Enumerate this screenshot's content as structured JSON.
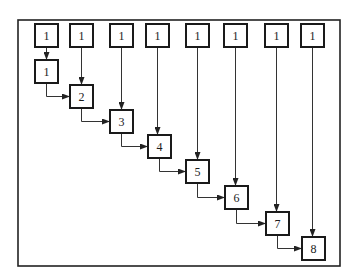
{
  "diagram": {
    "type": "cascade-flow",
    "frame": {
      "x": 18,
      "y": 20,
      "w": 322,
      "h": 246
    },
    "box_size": 23,
    "top_row": [
      {
        "label": "1",
        "x": 35
      },
      {
        "label": "1",
        "x": 70
      },
      {
        "label": "1",
        "x": 110
      },
      {
        "label": "1",
        "x": 146
      },
      {
        "label": "1",
        "x": 186
      },
      {
        "label": "1",
        "x": 224
      },
      {
        "label": "1",
        "x": 265
      },
      {
        "label": "1",
        "x": 301
      }
    ],
    "top_row_y": 24,
    "cascade": [
      {
        "label": "1",
        "x": 35,
        "y": 60
      },
      {
        "label": "2",
        "x": 70,
        "y": 85
      },
      {
        "label": "3",
        "x": 110,
        "y": 110
      },
      {
        "label": "4",
        "x": 148,
        "y": 135
      },
      {
        "label": "5",
        "x": 186,
        "y": 160
      },
      {
        "label": "6",
        "x": 225,
        "y": 186
      },
      {
        "label": "7",
        "x": 266,
        "y": 212
      },
      {
        "label": "8",
        "x": 302,
        "y": 237
      }
    ],
    "edges_description": "Each top box i has a vertical arrow down to cascade box i; each cascade box i has an elbow arrow (down then right) into cascade box i+1."
  }
}
